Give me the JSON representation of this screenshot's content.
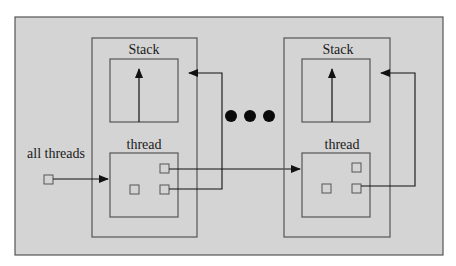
{
  "diagram": {
    "background_color": "#d4d4d4",
    "line_color": "#555555",
    "arrow_color": "#111111",
    "labels": {
      "all_threads": "all threads",
      "ellipsis": "•••"
    },
    "thread_objects": [
      {
        "stack_label": "Stack",
        "thread_label": "thread"
      },
      {
        "stack_label": "Stack",
        "thread_label": "thread"
      }
    ]
  }
}
